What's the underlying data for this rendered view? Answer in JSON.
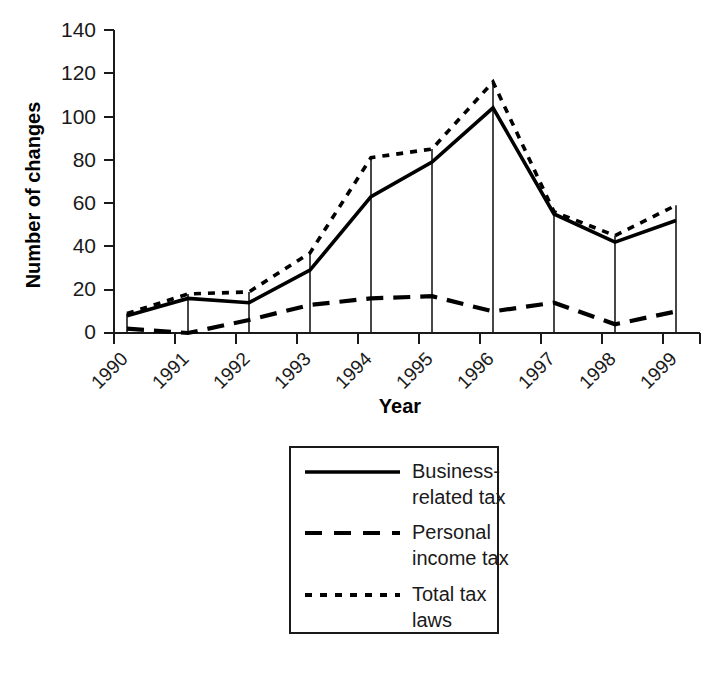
{
  "chart_data": {
    "type": "line",
    "title": "",
    "subtitle": "",
    "xlabel": "Year",
    "ylabel": "Number of changes",
    "categories": [
      "1990",
      "1991",
      "1992",
      "1993",
      "1994",
      "1995",
      "1996",
      "1997",
      "1998",
      "1999"
    ],
    "x": [
      1990,
      1991,
      1992,
      1993,
      1994,
      1995,
      1996,
      1997,
      1998,
      1999
    ],
    "ylim": [
      0,
      140
    ],
    "yticks": [
      0,
      20,
      40,
      60,
      80,
      100,
      120,
      140
    ],
    "ytick_labels": [
      "0",
      "20",
      "40",
      "60",
      "80",
      "100",
      "120",
      "140"
    ],
    "grid": false,
    "legend_position": "below-center",
    "series": [
      {
        "name": "Business-related tax",
        "style": "solid",
        "color": "#000000",
        "values": [
          8,
          16,
          14,
          29,
          63,
          79,
          104,
          55,
          42,
          52
        ]
      },
      {
        "name": "Personal income tax",
        "style": "dashed",
        "color": "#000000",
        "values": [
          2,
          0,
          6,
          13,
          16,
          17,
          10,
          14,
          4,
          10
        ]
      },
      {
        "name": "Total tax laws",
        "style": "dotted",
        "color": "#000000",
        "values": [
          9,
          18,
          19,
          37,
          81,
          85,
          116,
          56,
          45,
          59
        ]
      }
    ],
    "annotations": [
      "vertical drop lines from the Total tax laws series down to the x axis at each year"
    ]
  },
  "axes": {
    "y_title": "Number of changes",
    "x_title": "Year"
  },
  "legend": {
    "entries": [
      {
        "label_line1": "Business-",
        "label_line2": "related tax",
        "style": "solid",
        "name": "legend-business-related-tax"
      },
      {
        "label_line1": "Personal",
        "label_line2": "income tax",
        "style": "dashed",
        "name": "legend-personal-income-tax"
      },
      {
        "label_line1": "Total tax",
        "label_line2": "laws",
        "style": "dotted",
        "name": "legend-total-tax-laws"
      }
    ]
  },
  "colors": {
    "ink": "#000000",
    "axis": "#1a1a1a",
    "background": "#ffffff"
  }
}
